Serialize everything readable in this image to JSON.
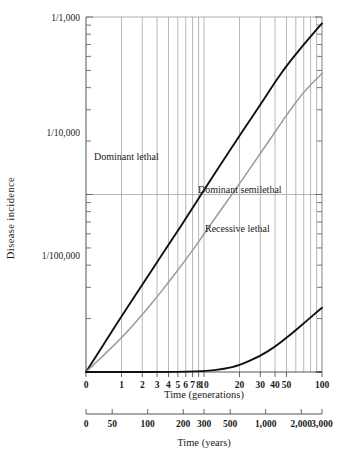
{
  "chart_data": {
    "type": "line",
    "title": "",
    "xlabel": "Time (generations)",
    "ylabel": "Disease incidence",
    "x_scale": "log",
    "y_scale": "log",
    "xlim": [
      1,
      100
    ],
    "ylim": [
      1e-05,
      0.001
    ],
    "grid": true,
    "legend_position": "inline-annotations",
    "x_ticks": [
      {
        "value": 1,
        "label": "0"
      },
      {
        "value": 2,
        "label": "1"
      },
      {
        "value": 3,
        "label": "2"
      },
      {
        "value": 4,
        "label": "3"
      },
      {
        "value": 5,
        "label": "4"
      },
      {
        "value": 6,
        "label": "5"
      },
      {
        "value": 7,
        "label": "6"
      },
      {
        "value": 8,
        "label": "7"
      },
      {
        "value": 9,
        "label": "8"
      },
      {
        "value": 10,
        "label": "10"
      },
      {
        "value": 20,
        "label": "20"
      },
      {
        "value": 30,
        "label": "30"
      },
      {
        "value": 40,
        "label": "40"
      },
      {
        "value": 50,
        "label": "50"
      },
      {
        "value": 100,
        "label": "100"
      }
    ],
    "y_ticks": [
      {
        "value": 0.001,
        "label": "1/1,000"
      },
      {
        "value": 0.0001,
        "label": "1/10,000"
      },
      {
        "value": 1e-05,
        "label": "1/100,000"
      }
    ],
    "secondary_axis": {
      "label": "Time (years)",
      "ticks": [
        {
          "value": 0,
          "label": "0"
        },
        {
          "value": 50,
          "label": "50"
        },
        {
          "value": 100,
          "label": "100"
        },
        {
          "value": 200,
          "label": "200"
        },
        {
          "value": 300,
          "label": "300"
        },
        {
          "value": 500,
          "label": "500"
        },
        {
          "value": 1000,
          "label": "1,000"
        },
        {
          "value": 2000,
          "label": "2,000"
        },
        {
          "value": 3000,
          "label": "3,000"
        }
      ]
    },
    "series": [
      {
        "name": "Dominant lethal",
        "color": "#111111",
        "width": 1.9,
        "annotation": "Dominant lethal",
        "points": [
          [
            1,
            1e-05
          ],
          [
            2,
            2.06e-05
          ],
          [
            3,
            3.1e-05
          ],
          [
            4,
            4.15e-05
          ],
          [
            5,
            5.2e-05
          ],
          [
            6,
            6.25e-05
          ],
          [
            7,
            7.3e-05
          ],
          [
            8,
            8.4e-05
          ],
          [
            9,
            9.5e-05
          ],
          [
            10,
            0.000106
          ],
          [
            20,
            0.000215
          ],
          [
            30,
            0.00032
          ],
          [
            40,
            0.00043
          ],
          [
            50,
            0.00053
          ],
          [
            70,
            0.0007
          ],
          [
            100,
            0.00092
          ]
        ]
      },
      {
        "name": "Dominant semilethal",
        "color": "#9a9a9a",
        "width": 1.5,
        "annotation": "Dominant semilethal",
        "points": [
          [
            1,
            1e-05
          ],
          [
            2,
            1.55e-05
          ],
          [
            3,
            2.1e-05
          ],
          [
            4,
            2.65e-05
          ],
          [
            5,
            3.2e-05
          ],
          [
            6,
            3.75e-05
          ],
          [
            7,
            4.3e-05
          ],
          [
            8,
            4.85e-05
          ],
          [
            9,
            5.4e-05
          ],
          [
            10,
            6e-05
          ],
          [
            20,
            0.000115
          ],
          [
            30,
            0.00017
          ],
          [
            40,
            0.000225
          ],
          [
            50,
            0.00028
          ],
          [
            70,
            0.00038
          ],
          [
            100,
            0.00048
          ]
        ]
      },
      {
        "name": "Recessive lethal",
        "color": "#111111",
        "width": 1.9,
        "annotation": "Recessive lethal",
        "points": [
          [
            1,
            1e-05
          ],
          [
            5,
            1e-05
          ],
          [
            10,
            1.01e-05
          ],
          [
            15,
            1.04e-05
          ],
          [
            20,
            1.09e-05
          ],
          [
            30,
            1.23e-05
          ],
          [
            40,
            1.39e-05
          ],
          [
            50,
            1.56e-05
          ],
          [
            60,
            1.72e-05
          ],
          [
            70,
            1.88e-05
          ],
          [
            80,
            2.03e-05
          ],
          [
            90,
            2.17e-05
          ],
          [
            100,
            2.3e-05
          ]
        ]
      }
    ]
  },
  "annotations": {
    "dominant_lethal": "Dominant lethal",
    "dominant_semilethal": "Dominant semilethal",
    "recessive_lethal": "Recessive lethal"
  },
  "axes": {
    "y_title": "Disease incidence",
    "x_title": "Time (generations)",
    "x2_title": "Time (years)",
    "y_tick_1": "1/1,000",
    "y_tick_2": "1/10,000",
    "y_tick_3": "1/100,000",
    "x_tick_0": "0",
    "x_tick_1": "1",
    "x_tick_2": "2",
    "x_tick_3": "3",
    "x_tick_4": "4",
    "x_tick_5": "5",
    "x_tick_6": "6",
    "x_tick_7": "7",
    "x_tick_8": "8",
    "x_tick_10": "10",
    "x_tick_20": "20",
    "x_tick_30": "30",
    "x_tick_40": "40",
    "x_tick_50": "50",
    "x_tick_100": "100",
    "x2_tick_0": "0",
    "x2_tick_50": "50",
    "x2_tick_100": "100",
    "x2_tick_200": "200",
    "x2_tick_300": "300",
    "x2_tick_500": "500",
    "x2_tick_1000": "1,000",
    "x2_tick_2000": "2,000",
    "x2_tick_3000": "3,000"
  },
  "colors": {
    "axis": "#555555",
    "grid": "#9a9a9a",
    "curve_dark": "#111111",
    "curve_light": "#9a9a9a",
    "text": "#1a1a1a",
    "background": "#ffffff"
  }
}
